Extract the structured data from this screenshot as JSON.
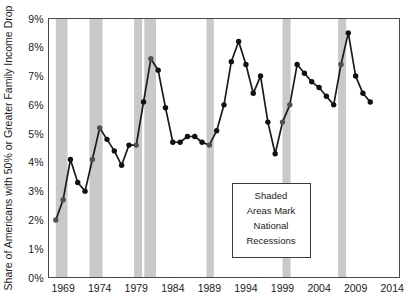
{
  "chart_data": {
    "type": "line",
    "title": "",
    "xlabel": "",
    "ylabel": "Share of Americans with 50% or Greater Family Income Drop",
    "xlim": [
      1967,
      2015
    ],
    "ylim": [
      0,
      9
    ],
    "grid": false,
    "legend_position": "none",
    "y_tick_labels": [
      "0%",
      "1%",
      "2%",
      "3%",
      "4%",
      "5%",
      "6%",
      "7%",
      "8%",
      "9%"
    ],
    "y_tick_values": [
      0,
      1,
      2,
      3,
      4,
      5,
      6,
      7,
      8,
      9
    ],
    "x_tick_labels": [
      "1969",
      "1974",
      "1979",
      "1984",
      "1989",
      "1994",
      "1999",
      "2004",
      "2009",
      "2014"
    ],
    "x_tick_values": [
      1969,
      1974,
      1979,
      1984,
      1989,
      1994,
      1999,
      2004,
      2009,
      2014
    ],
    "series": [
      {
        "name": "Share of Americans with 50% or Greater Family Income Drop",
        "color": "#111111",
        "x": [
          1968,
          1969,
          1970,
          1971,
          1972,
          1973,
          1974,
          1975,
          1976,
          1977,
          1978,
          1979,
          1980,
          1981,
          1982,
          1983,
          1984,
          1985,
          1986,
          1987,
          1988,
          1989,
          1990,
          1991,
          1992,
          1993,
          1994,
          1995,
          1996,
          1997,
          1998,
          1999,
          2000,
          2001,
          2002,
          2003,
          2004,
          2005,
          2006,
          2007,
          2008,
          2009,
          2010,
          2011
        ],
        "values": [
          2.0,
          2.7,
          4.1,
          3.3,
          3.0,
          4.1,
          5.2,
          4.8,
          4.4,
          3.9,
          4.6,
          4.6,
          6.1,
          7.6,
          7.2,
          5.9,
          4.7,
          4.7,
          4.9,
          4.9,
          4.7,
          4.6,
          5.1,
          6.0,
          7.5,
          8.2,
          7.4,
          6.4,
          7.0,
          5.4,
          4.3,
          5.4,
          6.0,
          7.4,
          7.1,
          6.8,
          6.6,
          6.3,
          6.0,
          7.4,
          8.5,
          7.0,
          6.4,
          6.1
        ]
      }
    ],
    "annotations": [
      {
        "name": "recession-note",
        "lines": [
          "Shaded",
          "Areas Mark",
          "National",
          "Recessions"
        ]
      }
    ],
    "shaded_regions": {
      "label": "National Recessions",
      "color": "#c9c9c9",
      "bands": [
        {
          "start": 1968.0,
          "end": 1969.6
        },
        {
          "start": 1972.6,
          "end": 1974.4
        },
        {
          "start": 1978.7,
          "end": 1979.8
        },
        {
          "start": 1980.1,
          "end": 1981.7
        },
        {
          "start": 1988.6,
          "end": 1989.6
        },
        {
          "start": 1999.0,
          "end": 2000.1
        },
        {
          "start": 2006.6,
          "end": 2007.7
        }
      ]
    }
  }
}
